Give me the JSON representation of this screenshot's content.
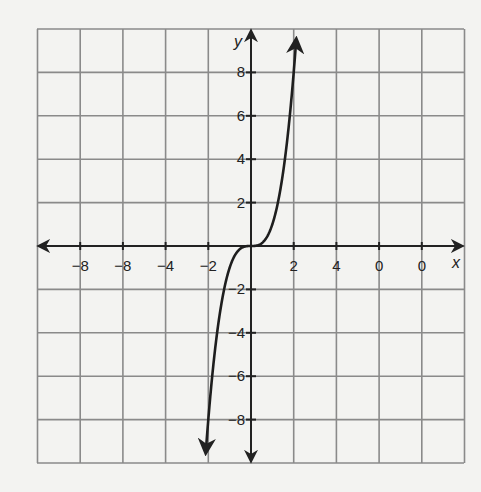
{
  "chart_data": {
    "type": "line",
    "title": "",
    "xlabel": "x",
    "ylabel": "y",
    "xlim": [
      -10,
      10
    ],
    "ylim": [
      -10,
      10
    ],
    "grid": true,
    "grid_step": 2,
    "x_tick_labels": [
      "-8",
      "-6",
      "-4",
      "-2",
      "2",
      "4",
      "6",
      "8"
    ],
    "x_tick_labels_as_printed": [
      "−8",
      "−8",
      "−4",
      "−2",
      "2",
      "4",
      "0",
      "0"
    ],
    "y_tick_labels": [
      "8",
      "6",
      "4",
      "2",
      "-2",
      "-4",
      "-6",
      "-8"
    ],
    "series": [
      {
        "name": "y = x^3",
        "description": "cubic curve through origin with arrows at both ends",
        "x": [
          -2.15,
          -2,
          -1.8,
          -1.5,
          -1.2,
          -1,
          -0.6,
          0,
          0.6,
          1,
          1.2,
          1.5,
          1.8,
          2,
          2.15
        ],
        "y": [
          -9.94,
          -8,
          -5.83,
          -3.38,
          -1.73,
          -1,
          -0.22,
          0,
          0.22,
          1,
          1.73,
          3.38,
          5.83,
          8,
          9.94
        ]
      }
    ],
    "colors": {
      "grid": "#8a8a8a",
      "axes": "#222222",
      "curve": "#1e1e1e",
      "background": "#f3f3f1"
    }
  }
}
